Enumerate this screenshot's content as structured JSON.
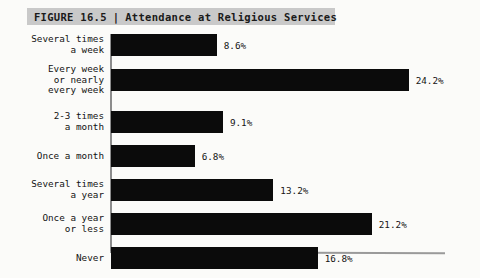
{
  "figure": {
    "label": "FIGURE 16.5",
    "separator": "|",
    "title": "Attendance at Religious Services"
  },
  "colors": {
    "bar": "#0b0b0b",
    "title_band": "#c9c9c9",
    "background": "#fbfbf9",
    "axis": "#8c8c8c"
  },
  "chart_data": {
    "type": "bar",
    "orientation": "horizontal",
    "title": "Attendance at Religious Services",
    "xlabel": "",
    "ylabel": "",
    "xlim": [
      0,
      24.2
    ],
    "grid": false,
    "legend": null,
    "value_suffix": "%",
    "categories": [
      "Several times\na week",
      "Every week\nor nearly\nevery week",
      "2-3 times\na month",
      "Once a month",
      "Several times\na year",
      "Once a year\nor less",
      "Never"
    ],
    "values": [
      8.6,
      24.2,
      9.1,
      6.8,
      13.2,
      21.2,
      16.8
    ],
    "data_labels": [
      "8.6%",
      "24.2%",
      "9.1%",
      "6.8%",
      "13.2%",
      "21.2%",
      "16.8%"
    ]
  }
}
